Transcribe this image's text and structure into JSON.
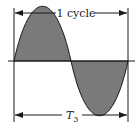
{
  "diagram": {
    "top_label": "1 cycle",
    "bottom_label_main": "T",
    "bottom_label_sub": "3",
    "colors": {
      "fill": "#7a7a7a",
      "stroke": "#1a1a1a",
      "background": "#ffffff"
    }
  }
}
